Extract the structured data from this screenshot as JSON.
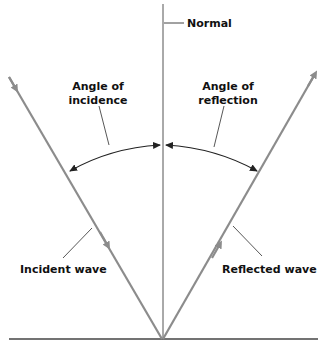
{
  "diagram": {
    "labels": {
      "normal": "Normal",
      "angle_incidence_line1": "Angle of",
      "angle_incidence_line2": "incidence",
      "angle_reflection_line1": "Angle of",
      "angle_reflection_line2": "reflection",
      "incident_wave": "Incident wave",
      "reflected_wave": "Reflected wave"
    },
    "colors": {
      "wave": "#8c8c8c",
      "normal_line": "#555555",
      "surface": "#444444",
      "arc": "#222222",
      "leader": "#444444",
      "text": "#111111"
    }
  }
}
